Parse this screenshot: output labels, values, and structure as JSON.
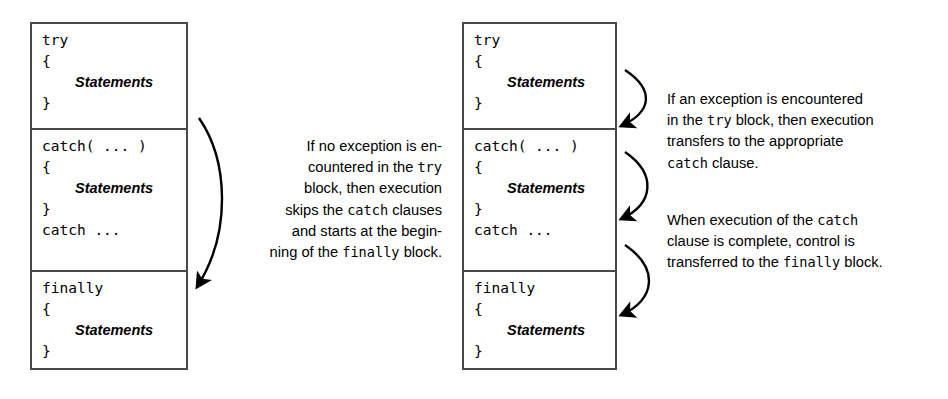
{
  "diagram": {
    "background_color": "#ffffff",
    "line_color": "#4a4a4a",
    "text_color": "#000000"
  },
  "left_figure": {
    "name": "no-exception-flow",
    "code_block": {
      "sections": [
        {
          "name": "try",
          "lines": [
            {
              "type": "code",
              "text": "try"
            },
            {
              "type": "code",
              "text": "{"
            },
            {
              "type": "statements",
              "text": "Statements"
            },
            {
              "type": "code",
              "text": "}"
            }
          ]
        },
        {
          "name": "catch",
          "lines": [
            {
              "type": "code",
              "text": "catch( ... )"
            },
            {
              "type": "code",
              "text": "{"
            },
            {
              "type": "statements",
              "text": "Statements"
            },
            {
              "type": "code",
              "text": "}"
            },
            {
              "type": "code",
              "text": "catch ..."
            }
          ]
        },
        {
          "name": "finally",
          "lines": [
            {
              "type": "code",
              "text": "finally"
            },
            {
              "type": "code",
              "text": "{"
            },
            {
              "type": "statements",
              "text": "Statements"
            },
            {
              "type": "code",
              "text": "}"
            }
          ]
        }
      ]
    },
    "note": {
      "lines": [
        [
          {
            "t": "If no exception is en-",
            "m": false
          }
        ],
        [
          {
            "t": "countered in the ",
            "m": false
          },
          {
            "t": "try",
            "m": true
          }
        ],
        [
          {
            "t": "block, then execution",
            "m": false
          }
        ],
        [
          {
            "t": "skips the ",
            "m": false
          },
          {
            "t": "catch",
            "m": true
          },
          {
            "t": " clauses",
            "m": false
          }
        ],
        [
          {
            "t": "and starts at the begin-",
            "m": false
          }
        ],
        [
          {
            "t": "ning of the ",
            "m": false
          },
          {
            "t": "finally",
            "m": true
          },
          {
            "t": " block.",
            "m": false
          }
        ]
      ]
    },
    "arrows": [
      {
        "name": "try-to-finally-arrow",
        "from": "try-section",
        "to": "finally-section"
      }
    ]
  },
  "right_figure": {
    "name": "exception-thrown-flow",
    "code_block": {
      "sections": [
        {
          "name": "try",
          "lines": [
            {
              "type": "code",
              "text": "try"
            },
            {
              "type": "code",
              "text": "{"
            },
            {
              "type": "statements",
              "text": "Statements"
            },
            {
              "type": "code",
              "text": "}"
            }
          ]
        },
        {
          "name": "catch",
          "lines": [
            {
              "type": "code",
              "text": "catch( ... )"
            },
            {
              "type": "code",
              "text": "{"
            },
            {
              "type": "statements",
              "text": "Statements"
            },
            {
              "type": "code",
              "text": "}"
            },
            {
              "type": "code",
              "text": "catch ..."
            }
          ]
        },
        {
          "name": "finally",
          "lines": [
            {
              "type": "code",
              "text": "finally"
            },
            {
              "type": "code",
              "text": "{"
            },
            {
              "type": "statements",
              "text": "Statements"
            },
            {
              "type": "code",
              "text": "}"
            }
          ]
        }
      ]
    },
    "note_1": {
      "lines": [
        [
          {
            "t": "If an exception is encountered",
            "m": false
          }
        ],
        [
          {
            "t": "in the ",
            "m": false
          },
          {
            "t": "try",
            "m": true
          },
          {
            "t": " block, then execution",
            "m": false
          }
        ],
        [
          {
            "t": "transfers to the appropriate",
            "m": false
          }
        ],
        [
          {
            "t": "catch",
            "m": true
          },
          {
            "t": " clause.",
            "m": false
          }
        ]
      ]
    },
    "note_2": {
      "lines": [
        [
          {
            "t": "When execution of the ",
            "m": false
          },
          {
            "t": "catch",
            "m": true
          }
        ],
        [
          {
            "t": "clause is complete, control is",
            "m": false
          }
        ],
        [
          {
            "t": "transferred to the ",
            "m": false
          },
          {
            "t": "finally",
            "m": true
          },
          {
            "t": " block.",
            "m": false
          }
        ]
      ]
    },
    "arrows": [
      {
        "name": "try-to-catch-arrow",
        "from": "try-section",
        "to": "catch-section"
      },
      {
        "name": "catch-to-catch-arrow",
        "from": "catch-section",
        "to": "catch-section-end"
      },
      {
        "name": "catch-to-finally-arrow",
        "from": "catch-section",
        "to": "finally-section"
      }
    ]
  }
}
